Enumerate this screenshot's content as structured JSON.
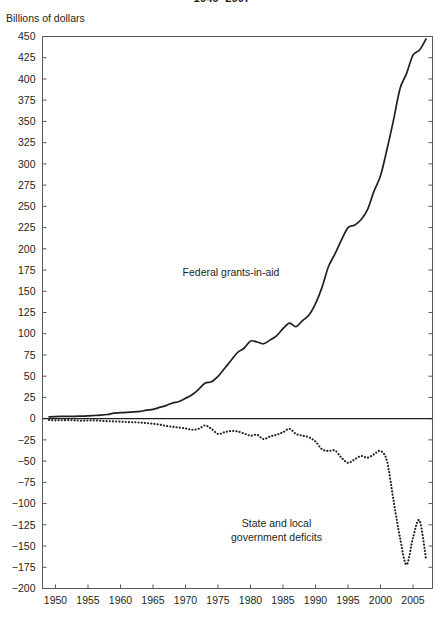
{
  "figure": {
    "title_partial": "1949–2007",
    "unit_label": "Billions of dollars"
  },
  "chart_data": {
    "type": "line",
    "title": "1949–2007",
    "subtitle": "",
    "xlabel": "",
    "ylabel": "Billions of dollars",
    "xlim": [
      1948,
      2008
    ],
    "ylim": [
      -200,
      450
    ],
    "ytick_step": 25,
    "xtick_step": 5,
    "grid": false,
    "legend_position": "inline-annotations",
    "zero_line": true,
    "yticks": [
      450,
      425,
      400,
      375,
      350,
      325,
      300,
      275,
      250,
      225,
      200,
      175,
      150,
      125,
      100,
      75,
      50,
      25,
      0,
      -25,
      -50,
      -75,
      -100,
      -125,
      -150,
      -175,
      -200
    ],
    "ytick_labels": [
      "450",
      "425",
      "400",
      "375",
      "350",
      "325",
      "300",
      "275",
      "250",
      "225",
      "200",
      "175",
      "150",
      "125",
      "100",
      "75",
      "50",
      "25",
      "0",
      "−25",
      "−50",
      "−75",
      "−100",
      "−125",
      "−150",
      "−175",
      "−200"
    ],
    "xticks": [
      1950,
      1955,
      1960,
      1965,
      1970,
      1975,
      1980,
      1985,
      1990,
      1995,
      2000,
      2005
    ],
    "xtick_labels": [
      "1950",
      "1955",
      "1960",
      "1965",
      "1970",
      "1975",
      "1980",
      "1985",
      "1990",
      "1995",
      "2000",
      "2005"
    ],
    "x": [
      1949,
      1950,
      1951,
      1952,
      1953,
      1954,
      1955,
      1956,
      1957,
      1958,
      1959,
      1960,
      1961,
      1962,
      1963,
      1964,
      1965,
      1966,
      1967,
      1968,
      1969,
      1970,
      1971,
      1972,
      1973,
      1974,
      1975,
      1976,
      1977,
      1978,
      1979,
      1980,
      1981,
      1982,
      1983,
      1984,
      1985,
      1986,
      1987,
      1988,
      1989,
      1990,
      1991,
      1992,
      1993,
      1994,
      1995,
      1996,
      1997,
      1998,
      1999,
      2000,
      2001,
      2002,
      2003,
      2004,
      2005,
      2006,
      2007
    ],
    "series": [
      {
        "name": "Federal grants-in-aid",
        "style": "solid",
        "color": "#231f20",
        "label_x": 1977,
        "label_y": 168,
        "values": [
          2.2,
          2.5,
          2.6,
          2.7,
          2.8,
          3.0,
          3.2,
          3.7,
          4.1,
          4.9,
          6.5,
          7.0,
          7.4,
          7.9,
          8.6,
          10.0,
          11.0,
          13.2,
          15.4,
          18.5,
          20.2,
          24.0,
          28.1,
          34.4,
          41.7,
          43.4,
          49.8,
          59.1,
          68.4,
          77.9,
          82.9,
          91.4,
          90.3,
          88.2,
          92.5,
          97.6,
          105.9,
          112.4,
          108.4,
          115.4,
          122.0,
          135.4,
          154.6,
          179.2,
          194.0,
          210.6,
          225.0,
          227.8,
          234.2,
          246.1,
          267.9,
          285.9,
          317.2,
          351.6,
          388.5,
          406.3,
          428.0,
          434.1,
          447.0
        ]
      },
      {
        "name": "State and local government deficits",
        "style": "dotted",
        "color": "#231f20",
        "label_x": 1984,
        "label_y": -128,
        "label_line1": "State and local",
        "label_line2": "government deficits",
        "values": [
          -1.5,
          -2.0,
          -1.8,
          -1.7,
          -2.0,
          -2.4,
          -2.2,
          -2.0,
          -2.5,
          -3.0,
          -3.2,
          -3.5,
          -4.0,
          -4.2,
          -4.6,
          -5.2,
          -6.0,
          -7.0,
          -8.5,
          -9.5,
          -10.5,
          -11.5,
          -13.0,
          -12.0,
          -8.0,
          -12.0,
          -18.0,
          -16.0,
          -14.5,
          -15.0,
          -17.5,
          -20.0,
          -19.0,
          -24.0,
          -21.0,
          -19.0,
          -16.0,
          -12.0,
          -18.0,
          -20.0,
          -22.0,
          -27.0,
          -36.0,
          -38.0,
          -37.5,
          -46.0,
          -52.0,
          -48.0,
          -44.0,
          -46.0,
          -42.0,
          -38.0,
          -50.0,
          -96.0,
          -140.0,
          -172.0,
          -140.0,
          -120.0,
          -165.0
        ]
      }
    ]
  }
}
